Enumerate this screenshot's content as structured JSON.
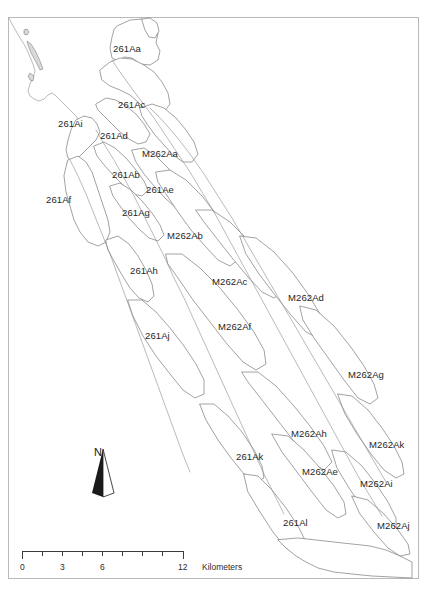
{
  "map": {
    "title_visible": false,
    "background_color": "#ffffff",
    "frame_color": "#b9b9b9",
    "polygon_stroke_color": "#6f6f6f",
    "label_color": "#262626",
    "labels": [
      {
        "text": "261Aa",
        "x": 113,
        "y": 44
      },
      {
        "text": "261Ac",
        "x": 118,
        "y": 100
      },
      {
        "text": "261Ai",
        "x": 58,
        "y": 119
      },
      {
        "text": "261Ad",
        "x": 100,
        "y": 131
      },
      {
        "text": "M262Aa",
        "x": 142,
        "y": 149
      },
      {
        "text": "261Ab",
        "x": 112,
        "y": 170
      },
      {
        "text": "261Ae",
        "x": 146,
        "y": 185
      },
      {
        "text": "261Af",
        "x": 46,
        "y": 195
      },
      {
        "text": "261Ag",
        "x": 122,
        "y": 208
      },
      {
        "text": "M262Ab",
        "x": 167,
        "y": 231
      },
      {
        "text": "261Ah",
        "x": 130,
        "y": 266
      },
      {
        "text": "M262Ac",
        "x": 212,
        "y": 277
      },
      {
        "text": "M262Ad",
        "x": 288,
        "y": 293
      },
      {
        "text": "M262Af",
        "x": 218,
        "y": 322
      },
      {
        "text": "261Aj",
        "x": 145,
        "y": 331
      },
      {
        "text": "M262Ag",
        "x": 348,
        "y": 370
      },
      {
        "text": "M262Ah",
        "x": 291,
        "y": 429
      },
      {
        "text": "M262Ak",
        "x": 369,
        "y": 440
      },
      {
        "text": "261Ak",
        "x": 236,
        "y": 452
      },
      {
        "text": "M262Ae",
        "x": 302,
        "y": 467
      },
      {
        "text": "M262Ai",
        "x": 360,
        "y": 479
      },
      {
        "text": "261Al",
        "x": 283,
        "y": 518
      },
      {
        "text": "M262Aj",
        "x": 377,
        "y": 521
      }
    ]
  },
  "north_arrow": {
    "letter": "N",
    "icon": "north-arrow-icon"
  },
  "scale_bar": {
    "labels": [
      "0",
      "3",
      "6",
      "12"
    ],
    "label_positions_px": [
      22,
      62,
      102,
      182
    ],
    "units": "Kilometers",
    "min": 0,
    "max": 12,
    "tick_interval": 1.5,
    "tick_count": 9
  }
}
